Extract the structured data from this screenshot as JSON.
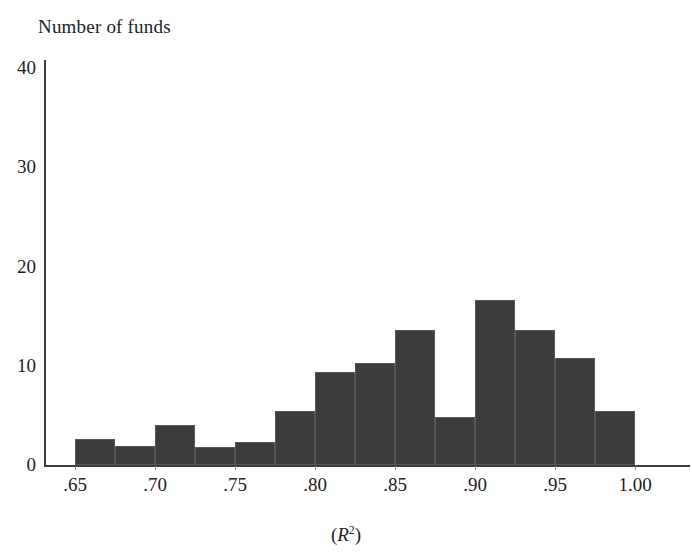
{
  "chart_data": {
    "type": "bar",
    "title": "Number of funds",
    "xlabel": "(R2)",
    "xlabel_base": "R",
    "xlabel_exponent": "2",
    "ylabel": "Number of funds",
    "grid": false,
    "legend": null,
    "bar_color": "#3c3c3c",
    "axis_color": "#3c3c3c",
    "xlim": [
      0.65,
      1.0
    ],
    "ylim": [
      0,
      40
    ],
    "bin_width": 0.025,
    "xticks": [
      ".65",
      ".70",
      ".75",
      ".80",
      ".85",
      ".90",
      ".95",
      "1.00"
    ],
    "xtick_values": [
      0.65,
      0.7,
      0.75,
      0.8,
      0.85,
      0.9,
      0.95,
      1.0
    ],
    "yticks": [
      "0",
      "10",
      "20",
      "30",
      "40"
    ],
    "ytick_values": [
      0,
      10,
      20,
      30,
      40
    ],
    "bins": [
      {
        "x0": 0.65,
        "x1": 0.675,
        "value": 2.6
      },
      {
        "x0": 0.675,
        "x1": 0.7,
        "value": 1.9
      },
      {
        "x0": 0.7,
        "x1": 0.725,
        "value": 4.0
      },
      {
        "x0": 0.725,
        "x1": 0.75,
        "value": 1.8
      },
      {
        "x0": 0.75,
        "x1": 0.775,
        "value": 2.3
      },
      {
        "x0": 0.775,
        "x1": 0.8,
        "value": 5.4
      },
      {
        "x0": 0.8,
        "x1": 0.825,
        "value": 9.4
      },
      {
        "x0": 0.825,
        "x1": 0.85,
        "value": 10.3
      },
      {
        "x0": 0.85,
        "x1": 0.875,
        "value": 13.6
      },
      {
        "x0": 0.875,
        "x1": 0.9,
        "value": 4.8
      },
      {
        "x0": 0.9,
        "x1": 0.925,
        "value": 16.6
      },
      {
        "x0": 0.925,
        "x1": 0.95,
        "value": 13.6
      },
      {
        "x0": 0.95,
        "x1": 0.975,
        "value": 10.8
      },
      {
        "x0": 0.975,
        "x1": 1.0,
        "value": 5.4
      }
    ],
    "categories": [
      ".650-.675",
      ".675-.700",
      ".700-.725",
      ".725-.750",
      ".750-.775",
      ".775-.800",
      ".800-.825",
      ".825-.850",
      ".850-.875",
      ".875-.900",
      ".900-.925",
      ".925-.950",
      ".950-.975",
      ".975-1.000"
    ],
    "values": [
      2.6,
      1.9,
      4.0,
      1.8,
      2.3,
      5.4,
      9.4,
      10.3,
      13.6,
      4.8,
      16.6,
      13.6,
      10.8,
      5.4
    ]
  }
}
